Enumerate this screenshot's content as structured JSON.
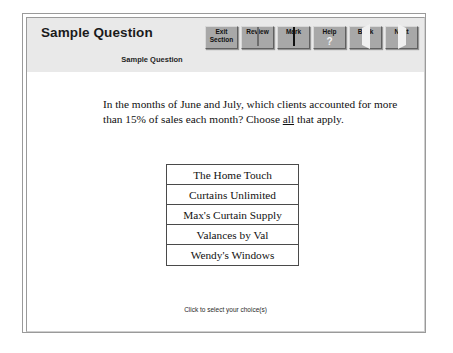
{
  "header": {
    "title": "Sample Question",
    "subtitle": "Sample Question"
  },
  "toolbar": {
    "buttons": [
      {
        "label_line1": "Exit",
        "label_line2": "Section",
        "icon": "none"
      },
      {
        "label_line1": "Review",
        "label_line2": "",
        "icon": "page-icon"
      },
      {
        "label_line1": "Mark",
        "label_line2": "",
        "icon": "checkbox-icon"
      },
      {
        "label_line1": "Help",
        "label_line2": "",
        "icon": "question-mark-icon"
      },
      {
        "label_line1": "Back",
        "label_line2": "",
        "icon": "triangle-left-icon"
      },
      {
        "label_line1": "Next",
        "label_line2": "",
        "icon": "triangle-right-icon"
      }
    ]
  },
  "question": {
    "stem_part1": "In the months of June and July, which clients accounted for more than 15% of sales each month? Choose ",
    "stem_emphasis": "all",
    "stem_part2": " that apply.",
    "choices": [
      {
        "label": "The Home Touch"
      },
      {
        "label": "Curtains Unlimited"
      },
      {
        "label": "Max's Curtain Supply"
      },
      {
        "label": "Valances by Val"
      },
      {
        "label": "Wendy's Windows"
      }
    ]
  },
  "footer": {
    "hint": "Click to select your choice(s)"
  },
  "colors": {
    "header_band": "#e9e9e9",
    "button_face": "#a8a8a8",
    "frame_border": "#9a9a9a",
    "text": "#111111",
    "page_background": "#ffffff"
  }
}
